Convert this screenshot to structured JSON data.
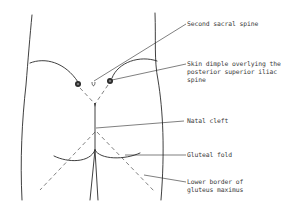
{
  "figure": {
    "type": "anatomical line drawing",
    "colors": {
      "line": "#2a2a2a",
      "text": "#3a3a3a",
      "background": "#ffffff"
    },
    "labels": [
      {
        "id": "second-sacral-spine",
        "text": "Second sacral spine"
      },
      {
        "id": "skin-dimple",
        "line1": "Skin dimple overlying the",
        "line2": "posterior superior iliac",
        "line3": "spine"
      },
      {
        "id": "natal-cleft",
        "text": "Natal cleft"
      },
      {
        "id": "gluteal-fold",
        "text": "Gluteal fold"
      },
      {
        "id": "lower-border",
        "line1": "Lower border of",
        "line2": "gluteus maximus"
      }
    ]
  }
}
